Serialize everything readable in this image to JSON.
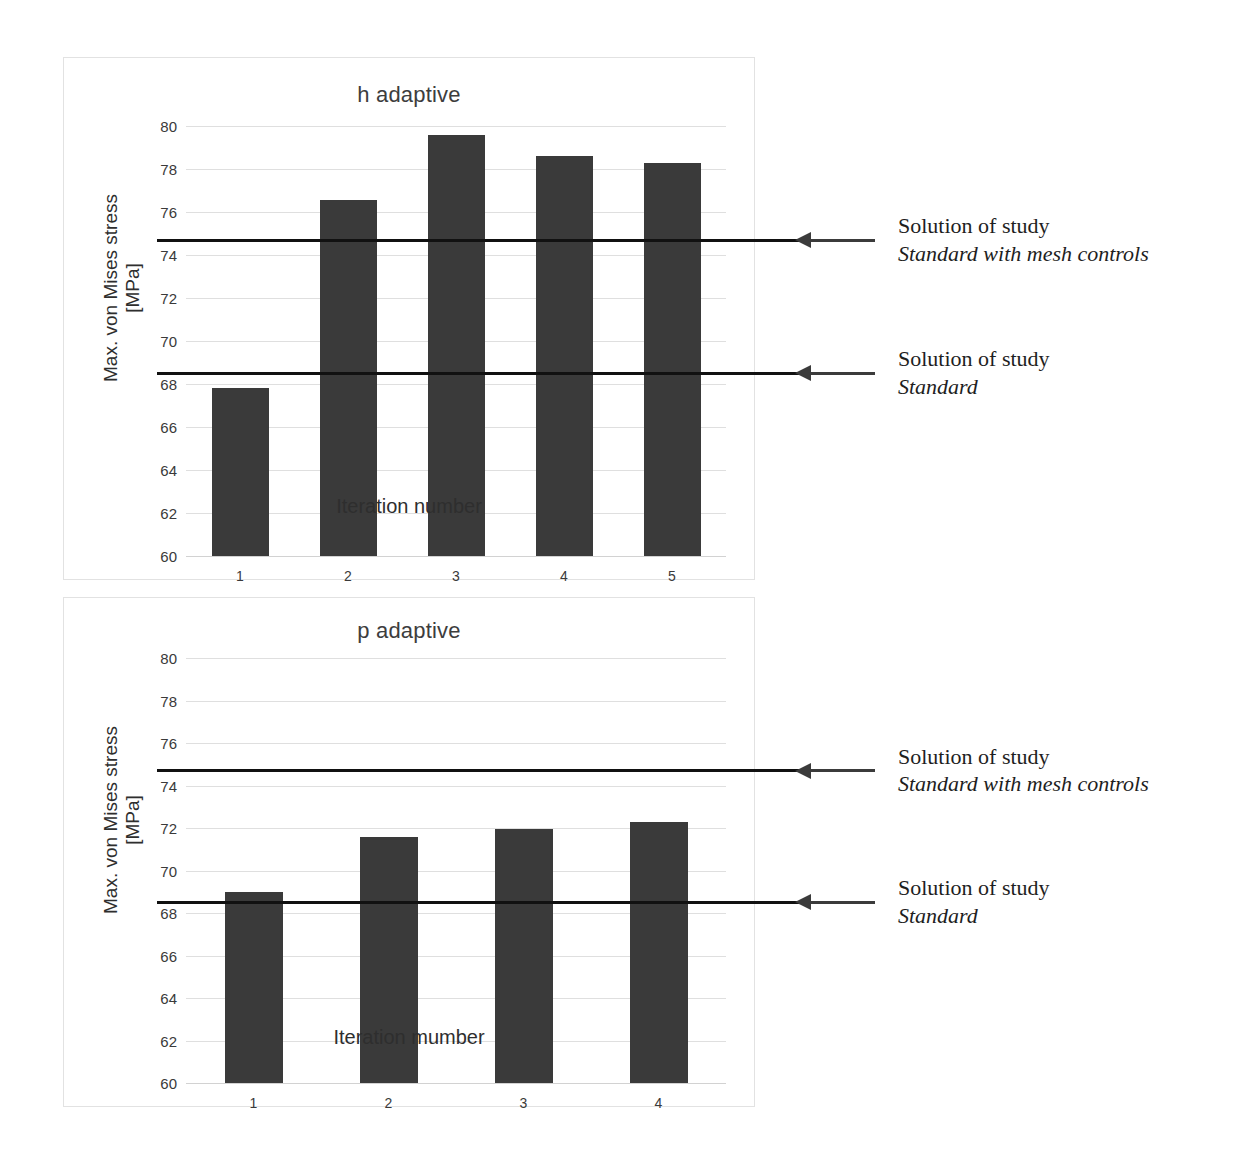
{
  "chart_data": [
    {
      "type": "bar",
      "id": "h-adaptive",
      "title": "h adaptive",
      "xlabel": "Iteration number",
      "ylabel": "Max. von Mises stress [MPa]",
      "ylabel_line1": "Max. von Mises stress",
      "ylabel_line2": "[MPa]",
      "categories": [
        "1",
        "2",
        "3",
        "4",
        "5"
      ],
      "values": [
        67.8,
        76.55,
        79.6,
        78.6,
        78.3
      ],
      "ylim": [
        60,
        80
      ],
      "ytick_step": 2,
      "yticks": [
        "80",
        "78",
        "76",
        "74",
        "72",
        "70",
        "68",
        "66",
        "64",
        "62",
        "60"
      ],
      "grid": true,
      "bar_color": "#3a3a3a",
      "gridline_color": "#dfdfdf",
      "reference_lines": [
        {
          "value": 74.65,
          "label_line1": "Solution of study",
          "label_line2": "Standard with mesh controls",
          "color": "#111111"
        },
        {
          "value": 68.45,
          "label_line1": "Solution of study",
          "label_line2": "Standard",
          "color": "#111111"
        }
      ]
    },
    {
      "type": "bar",
      "id": "p-adaptive",
      "title": "p adaptive",
      "xlabel": "Iteration mumber",
      "ylabel": "Max. von Mises stress [MPa]",
      "ylabel_line1": "Max. von Mises stress",
      "ylabel_line2": "[MPa]",
      "categories": [
        "1",
        "2",
        "3",
        "4"
      ],
      "values": [
        69.0,
        71.6,
        71.95,
        72.3
      ],
      "ylim": [
        60,
        80
      ],
      "ytick_step": 2,
      "yticks": [
        "80",
        "78",
        "76",
        "74",
        "72",
        "70",
        "68",
        "66",
        "64",
        "62",
        "60"
      ],
      "grid": true,
      "bar_color": "#3a3a3a",
      "gridline_color": "#dfdfdf",
      "reference_lines": [
        {
          "value": 74.65,
          "label_line1": "Solution of study",
          "label_line2": "Standard with mesh controls",
          "color": "#111111"
        },
        {
          "value": 68.45,
          "label_line1": "Solution of study",
          "label_line2": "Standard",
          "color": "#111111"
        }
      ]
    }
  ],
  "charts": {
    "h": {
      "title": "h adaptive",
      "xlabel": "Iteration number",
      "ylabel_line1": "Max. von Mises stress",
      "ylabel_line2": "[MPa]",
      "annotation_top": {
        "line1": "Solution of study",
        "line2": "Standard with mesh controls"
      },
      "annotation_bottom": {
        "line1": "Solution of study",
        "line2": "Standard"
      }
    },
    "p": {
      "title": "p adaptive",
      "xlabel": "Iteration mumber",
      "ylabel_line1": "Max. von Mises stress",
      "ylabel_line2": "[MPa]",
      "annotation_top": {
        "line1": "Solution of study",
        "line2": "Standard with mesh controls"
      },
      "annotation_bottom": {
        "line1": "Solution of study",
        "line2": "Standard"
      }
    }
  }
}
